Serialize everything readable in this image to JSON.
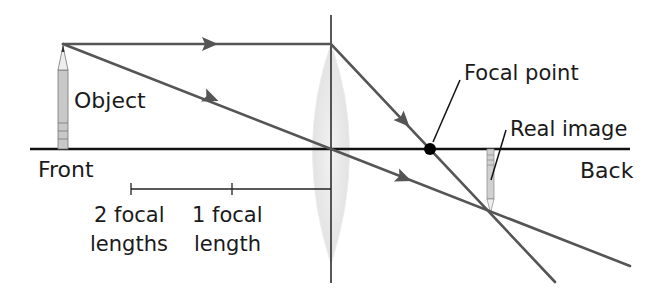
{
  "diagram": {
    "labels": {
      "object": "Object",
      "front": "Front",
      "back": "Back",
      "focal_point": "Focal point",
      "real_image": "Real image",
      "two_focal_line1": "2 focal",
      "two_focal_line2": "lengths",
      "one_focal_line1": "1 focal",
      "one_focal_line2": "length"
    },
    "colors": {
      "ray": "#555555",
      "axis": "#111111",
      "lens_fill": "#e6e6e6",
      "pencil_fill": "#c8c8c8"
    }
  }
}
